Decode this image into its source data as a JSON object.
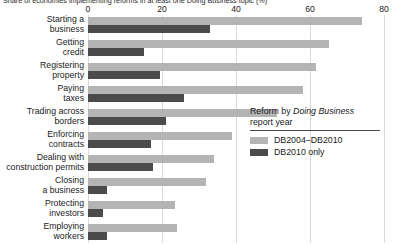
{
  "chart_data": {
    "type": "bar",
    "orientation": "horizontal",
    "grouped": true,
    "subtitle": "Share of economies implementing reforms in at least one Doing Business topic (%)",
    "title": "",
    "xlabel": "",
    "ylabel": "",
    "xlim": [
      0,
      80
    ],
    "xticks": [
      0,
      20,
      40,
      60,
      80
    ],
    "xtick_labels": [
      "0",
      "20",
      "40",
      "60",
      "80"
    ],
    "grid": "vertical",
    "legend_position": "middle-right",
    "legend_title_line1_prefix": "Reform by ",
    "legend_title_line1_emphasis": "Doing Business",
    "legend_title_line2": "report year",
    "categories": [
      "Starting a\nbusiness",
      "Getting\ncredit",
      "Registering\nproperty",
      "Paying\ntaxes",
      "Trading across\nborders",
      "Enforcing\ncontracts",
      "Dealing with\nconstruction permits",
      "Closing\na business",
      "Protecting\ninvestors",
      "Employing\nworkers"
    ],
    "series": [
      {
        "name": "DB2004–DB2010",
        "color": "#b4b4b4",
        "values": [
          74,
          65,
          61.5,
          58,
          51,
          39,
          34,
          32,
          23.5,
          24
        ]
      },
      {
        "name": "DB2010 only",
        "color": "#4b4b4b",
        "values": [
          33,
          15,
          19.5,
          26,
          21,
          17,
          17.5,
          5,
          4,
          5
        ]
      }
    ]
  },
  "axis": {
    "ticks": [
      {
        "label": "0",
        "value": 0
      },
      {
        "label": "20",
        "value": 20
      },
      {
        "label": "40",
        "value": 40
      },
      {
        "label": "60",
        "value": 60
      },
      {
        "label": "80",
        "value": 80
      }
    ]
  },
  "categories": [
    {
      "line1": "Starting a",
      "line2": "business"
    },
    {
      "line1": "Getting",
      "line2": "credit"
    },
    {
      "line1": "Registering",
      "line2": "property"
    },
    {
      "line1": "Paying",
      "line2": "taxes"
    },
    {
      "line1": "Trading across",
      "line2": "borders"
    },
    {
      "line1": "Enforcing",
      "line2": "contracts"
    },
    {
      "line1": "Dealing with",
      "line2": "construction permits"
    },
    {
      "line1": "Closing",
      "line2": "a business"
    },
    {
      "line1": "Protecting",
      "line2": "investors"
    },
    {
      "line1": "Employing",
      "line2": "workers"
    }
  ],
  "legend": {
    "title_prefix": "Reform by ",
    "title_emphasis": "Doing Business",
    "title_line2": "report year",
    "items": [
      {
        "label": "DB2004–DB2010",
        "color": "#b4b4b4"
      },
      {
        "label": "DB2010 only",
        "color": "#4b4b4b"
      }
    ]
  },
  "subtitle": "Share of economies implementing reforms in at least one Doing Business topic (%)",
  "colors": {
    "series_light": "#b4b4b4",
    "series_dark": "#4b4b4b",
    "gridline": "#d9d9d9",
    "text": "#1a1a1a",
    "background": "#ffffff"
  }
}
